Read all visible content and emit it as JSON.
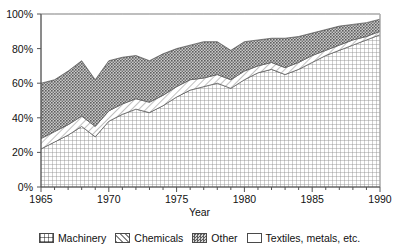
{
  "chart_data": {
    "type": "area",
    "stacked": true,
    "title": "",
    "subtitle": "",
    "xlabel": "Year",
    "ylabel": "",
    "xlim": [
      1965,
      1990
    ],
    "ylim": [
      0,
      100
    ],
    "grid": false,
    "legend_position": "bottom",
    "y_tick_labels": [
      "0%",
      "20%",
      "40%",
      "60%",
      "80%",
      "100%"
    ],
    "y_ticks": [
      0,
      20,
      40,
      60,
      80,
      100
    ],
    "x_tick_labels": [
      "1965",
      "1970",
      "1975",
      "1980",
      "1985",
      "1990"
    ],
    "x_ticks": [
      1965,
      1970,
      1975,
      1980,
      1985,
      1990
    ],
    "x_minor_tick_step": 1,
    "x": [
      1965,
      1966,
      1967,
      1968,
      1969,
      1970,
      1971,
      1972,
      1973,
      1974,
      1975,
      1976,
      1977,
      1978,
      1979,
      1980,
      1981,
      1982,
      1983,
      1984,
      1985,
      1986,
      1987,
      1988,
      1989,
      1990
    ],
    "series": [
      {
        "name": "Machinery",
        "pattern": "cross-hatch-grid",
        "color": "#e8e8e8",
        "values": [
          22,
          26,
          30,
          35,
          29,
          38,
          42,
          45,
          43,
          47,
          52,
          56,
          58,
          60,
          57,
          62,
          66,
          68,
          65,
          68,
          72,
          76,
          79,
          82,
          85,
          88
        ]
      },
      {
        "name": "Chemicals",
        "pattern": "diagonal-hatch",
        "color": "#f2f2f2",
        "values": [
          6,
          6,
          6,
          6,
          6,
          6,
          6,
          6,
          6,
          6,
          6,
          6,
          5,
          5,
          5,
          5,
          4,
          4,
          4,
          4,
          4,
          3,
          3,
          3,
          2,
          2
        ]
      },
      {
        "name": "Other",
        "pattern": "dark-stipple",
        "color": "#9a9a9a",
        "values": [
          32,
          30,
          31,
          32,
          27,
          29,
          27,
          25,
          24,
          24,
          22,
          20,
          21,
          19,
          17,
          17,
          15,
          14,
          17,
          15,
          13,
          12,
          11,
          9,
          8,
          7
        ]
      },
      {
        "name": "Textiles, metals, etc.",
        "pattern": "blank-white",
        "color": "#ffffff",
        "values": [
          40,
          38,
          33,
          27,
          38,
          27,
          25,
          24,
          27,
          23,
          20,
          18,
          16,
          16,
          21,
          16,
          15,
          14,
          14,
          13,
          11,
          9,
          7,
          6,
          5,
          3
        ]
      }
    ]
  },
  "legend": {
    "items": [
      {
        "label": "Machinery"
      },
      {
        "label": "Chemicals"
      },
      {
        "label": "Other"
      },
      {
        "label": "Textiles, metals, etc."
      }
    ]
  }
}
